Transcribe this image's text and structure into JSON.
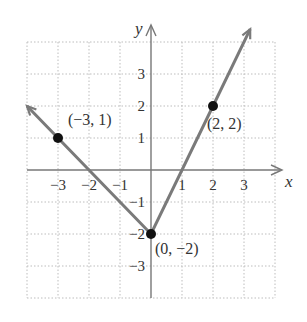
{
  "chart_data": {
    "type": "line",
    "title": "",
    "function": "piecewise linear V-shape with vertex (0, -2)",
    "xlabel": "x",
    "ylabel": "y",
    "xlim": [
      -4,
      4
    ],
    "ylim": [
      -4,
      4
    ],
    "grid": true,
    "x_ticks": [
      -3,
      -2,
      -1,
      1,
      2,
      3
    ],
    "x_tick_labels": [
      "−3",
      "−2",
      "−1",
      "1",
      "2",
      "3"
    ],
    "y_ticks": [
      3,
      2,
      1,
      -1,
      -2,
      -3
    ],
    "y_tick_labels": [
      "3",
      "2",
      "1",
      "−1",
      "−2",
      "−3"
    ],
    "series": [
      {
        "name": "graph",
        "x": [
          -4,
          -3,
          0,
          2,
          3.2
        ],
        "y": [
          2,
          1,
          -2,
          2,
          4.4
        ],
        "color": "#7a7a7a"
      }
    ],
    "points": [
      {
        "x": -3,
        "y": 1,
        "label": "(−3, 1)"
      },
      {
        "x": 0,
        "y": -2,
        "label": "(0, −2)"
      },
      {
        "x": 2,
        "y": 2,
        "label": "(2, 2)"
      }
    ]
  }
}
